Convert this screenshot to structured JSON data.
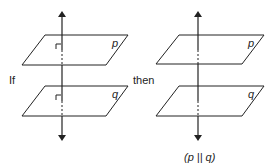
{
  "diagram": {
    "left_figure": {
      "condition_label": "If",
      "planes": [
        {
          "name": "p",
          "right_angle_mark": true
        },
        {
          "name": "q",
          "right_angle_mark": true
        }
      ],
      "line": "perpendicular line through both planes"
    },
    "right_figure": {
      "conclusion_label": "then",
      "planes": [
        {
          "name": "p"
        },
        {
          "name": "q"
        }
      ],
      "caption": "(p || q)"
    },
    "colors": {
      "stroke": "#222222",
      "background": "#ffffff"
    }
  }
}
